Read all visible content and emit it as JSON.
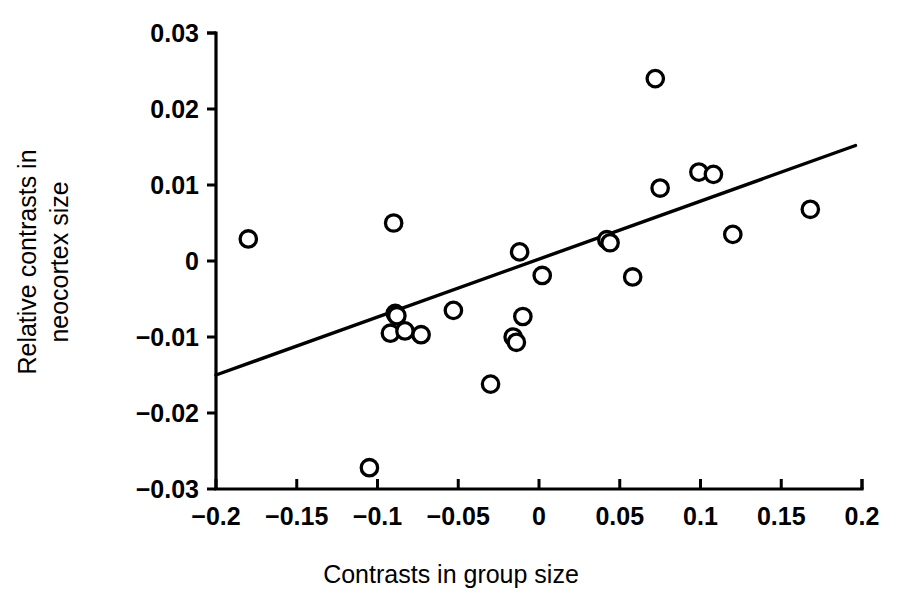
{
  "chart_data": {
    "type": "scatter",
    "title": "",
    "xlabel": "Contrasts in group size",
    "ylabel": "Relative contrasts in neocortex size",
    "ylabel_line1": "Relative contrasts in",
    "ylabel_line2": "neocortex size",
    "xlim": [
      -0.2,
      0.2
    ],
    "ylim": [
      -0.03,
      0.03
    ],
    "xticks": [
      -0.2,
      -0.15,
      -0.1,
      -0.05,
      0,
      0.05,
      0.1,
      0.15,
      0.2
    ],
    "yticks": [
      -0.03,
      -0.02,
      -0.01,
      0,
      0.01,
      0.02,
      0.03
    ],
    "xtick_labels": [
      "−0.2",
      "−0.15",
      "−0.1",
      "−0.05",
      "0",
      "0.05",
      "0.1",
      "0.15",
      "0.2"
    ],
    "ytick_labels": [
      "−0.03",
      "−0.02",
      "−0.01",
      "0",
      "0.01",
      "0.02",
      "0.03"
    ],
    "grid": false,
    "legend": false,
    "marker": "open-circle",
    "marker_color": "#000000",
    "marker_fill": "#ffffff",
    "points": [
      {
        "x": -0.18,
        "y": 0.0029
      },
      {
        "x": -0.105,
        "y": -0.0272
      },
      {
        "x": -0.092,
        "y": -0.0095
      },
      {
        "x": -0.09,
        "y": 0.005
      },
      {
        "x": -0.089,
        "y": -0.0069
      },
      {
        "x": -0.088,
        "y": -0.0072
      },
      {
        "x": -0.083,
        "y": -0.0092
      },
      {
        "x": -0.073,
        "y": -0.0097
      },
      {
        "x": -0.053,
        "y": -0.0065
      },
      {
        "x": -0.03,
        "y": -0.0162
      },
      {
        "x": -0.016,
        "y": -0.01
      },
      {
        "x": -0.014,
        "y": -0.0107
      },
      {
        "x": -0.012,
        "y": 0.0012
      },
      {
        "x": -0.01,
        "y": -0.0073
      },
      {
        "x": 0.002,
        "y": -0.0019
      },
      {
        "x": 0.042,
        "y": 0.0028
      },
      {
        "x": 0.044,
        "y": 0.0024
      },
      {
        "x": 0.058,
        "y": -0.0021
      },
      {
        "x": 0.072,
        "y": 0.024
      },
      {
        "x": 0.075,
        "y": 0.0096
      },
      {
        "x": 0.099,
        "y": 0.0117
      },
      {
        "x": 0.108,
        "y": 0.0114
      },
      {
        "x": 0.12,
        "y": 0.0035
      },
      {
        "x": 0.168,
        "y": 0.0068
      }
    ],
    "fit_line": {
      "x0": -0.2,
      "y0": -0.015,
      "x1": 0.196,
      "y1": 0.0152,
      "style": "solid",
      "color": "#000000"
    }
  }
}
